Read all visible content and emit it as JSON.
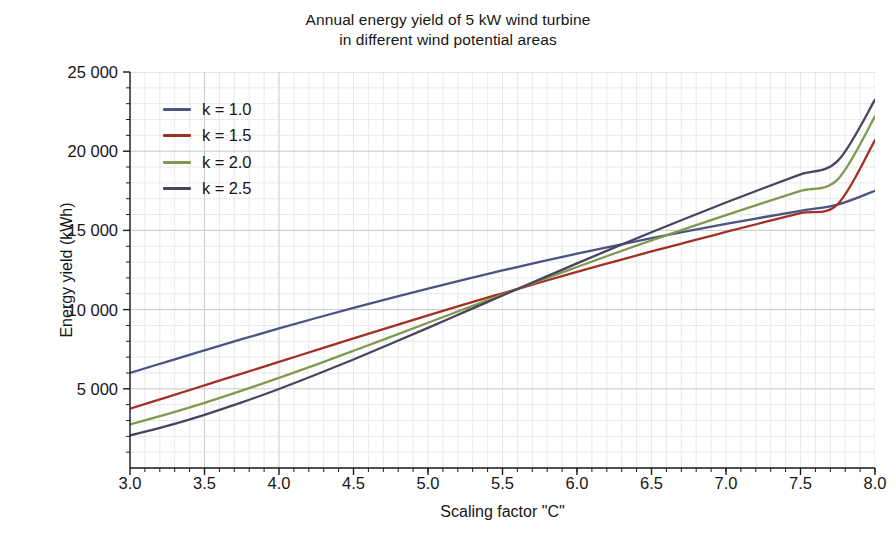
{
  "title": {
    "line1": "Annual energy yield of 5 kW wind turbine",
    "line2": "in different wind potential areas"
  },
  "axes": {
    "xlabel": "Scaling factor \"C\"",
    "ylabel": "Energy yield (kWh)",
    "xticks": [
      "3.0",
      "3.5",
      "4.0",
      "4.5",
      "5.0",
      "5.5",
      "6.0",
      "6.5",
      "7.0",
      "7.5",
      "8.0"
    ],
    "yticks": [
      "25 000",
      "20 000",
      "15 000",
      "10 000",
      "5 000"
    ]
  },
  "legend": {
    "items": [
      {
        "label": "k = 1.0",
        "color": "#4a5584"
      },
      {
        "label": "k = 1.5",
        "color": "#a33025"
      },
      {
        "label": "k = 2.0",
        "color": "#7d9a4f"
      },
      {
        "label": "k = 2.5",
        "color": "#4b4360"
      }
    ]
  },
  "chart_data": {
    "type": "line",
    "title": "Annual energy yield of 5 kW wind turbine in different wind potential areas",
    "xlabel": "Scaling factor \"C\"",
    "ylabel": "Energy yield (kWh)",
    "xlim": [
      3.0,
      8.0
    ],
    "ylim": [
      0,
      25000
    ],
    "xticks": [
      3.0,
      3.5,
      4.0,
      4.5,
      5.0,
      5.5,
      6.0,
      6.5,
      7.0,
      7.5,
      8.0
    ],
    "yticks": [
      5000,
      10000,
      15000,
      20000,
      25000
    ],
    "grid": true,
    "grid_minor": true,
    "legend_position": "upper-left-inside",
    "x": [
      3.0,
      3.25,
      3.5,
      3.75,
      4.0,
      4.25,
      4.5,
      4.75,
      5.0,
      5.25,
      5.5,
      5.75,
      6.0,
      6.25,
      6.5,
      6.75,
      7.0,
      7.25,
      7.5,
      7.75,
      8.0
    ],
    "series": [
      {
        "name": "k = 1.0",
        "color": "#4a5584",
        "values": [
          6000,
          6720,
          7430,
          8130,
          8810,
          9470,
          10110,
          10730,
          11330,
          11910,
          12470,
          13010,
          13530,
          14030,
          14510,
          14970,
          15410,
          15830,
          16240,
          16630,
          17500
        ]
      },
      {
        "name": "k = 1.5",
        "color": "#a33025",
        "values": [
          3750,
          4480,
          5220,
          5960,
          6700,
          7440,
          8180,
          8910,
          9630,
          10340,
          11030,
          11710,
          12380,
          13030,
          13670,
          14290,
          14900,
          15500,
          16090,
          16660,
          20700
        ]
      },
      {
        "name": "k = 2.0",
        "color": "#7d9a4f",
        "values": [
          2750,
          3400,
          4110,
          4880,
          5690,
          6530,
          7400,
          8280,
          9170,
          10060,
          10950,
          11830,
          12690,
          13540,
          14370,
          15180,
          15970,
          16740,
          17490,
          18220,
          22200
        ]
      },
      {
        "name": "k = 2.5",
        "color": "#4b4360",
        "values": [
          2050,
          2660,
          3360,
          4140,
          4990,
          5900,
          6850,
          7840,
          8850,
          9870,
          10890,
          11910,
          12920,
          13910,
          14880,
          15830,
          16760,
          17660,
          18540,
          19390,
          23250
        ]
      }
    ]
  }
}
